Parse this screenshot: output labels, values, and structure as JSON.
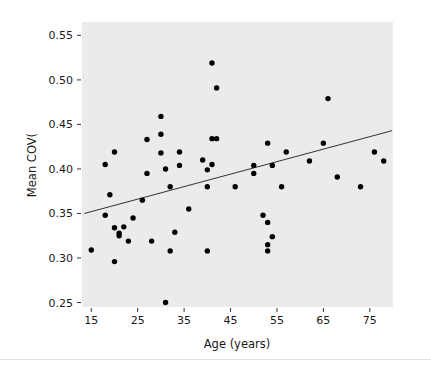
{
  "figure": {
    "background_color": "#ffffff",
    "panel_color": "#ebebeb",
    "point_color": "#000000",
    "line_color": "#333333",
    "text_color": "#1a1a1a"
  },
  "chart_data": {
    "type": "scatter",
    "title": "",
    "subtitle": "",
    "xlabel": "Age (years)",
    "ylabel": "Mean COV(",
    "xlim": [
      13,
      80
    ],
    "ylim": [
      0.245,
      0.565
    ],
    "xticks": [
      15,
      25,
      35,
      45,
      55,
      65,
      75
    ],
    "xtick_labels": [
      "15",
      "25",
      "35",
      "45",
      "55",
      "65",
      "75"
    ],
    "yticks": [
      0.25,
      0.3,
      0.35,
      0.4,
      0.45,
      0.5,
      0.55
    ],
    "ytick_labels": [
      "0.25",
      "0.30",
      "0.35",
      "0.40",
      "0.45",
      "0.50",
      "0.55"
    ],
    "grid": false,
    "legend": null,
    "legend_position": "none",
    "marker": "circle",
    "marker_size": 5,
    "x": [
      15,
      18,
      18,
      19,
      20,
      20,
      20,
      21,
      21,
      22,
      23,
      24,
      26,
      27,
      27,
      28,
      30,
      30,
      30,
      31,
      31,
      32,
      32,
      33,
      34,
      34,
      36,
      39,
      40,
      40,
      40,
      41,
      41,
      41,
      42,
      42,
      46,
      50,
      50,
      52,
      53,
      53,
      53,
      53,
      54,
      54,
      56,
      57,
      62,
      65,
      66,
      68,
      73,
      76,
      78
    ],
    "y": [
      0.309,
      0.405,
      0.348,
      0.371,
      0.419,
      0.296,
      0.334,
      0.328,
      0.325,
      0.335,
      0.319,
      0.345,
      0.365,
      0.433,
      0.395,
      0.319,
      0.459,
      0.439,
      0.418,
      0.25,
      0.4,
      0.38,
      0.308,
      0.329,
      0.419,
      0.404,
      0.355,
      0.41,
      0.399,
      0.308,
      0.38,
      0.519,
      0.434,
      0.405,
      0.491,
      0.434,
      0.38,
      0.404,
      0.395,
      0.348,
      0.34,
      0.315,
      0.308,
      0.429,
      0.404,
      0.324,
      0.38,
      0.419,
      0.409,
      0.429,
      0.479,
      0.391,
      0.38,
      0.419,
      0.409
    ],
    "trend_line": {
      "type": "linear_fit",
      "x_start": 13.5,
      "y_start": 0.35,
      "x_end": 79.8,
      "y_end": 0.443
    },
    "n_points": 55
  }
}
